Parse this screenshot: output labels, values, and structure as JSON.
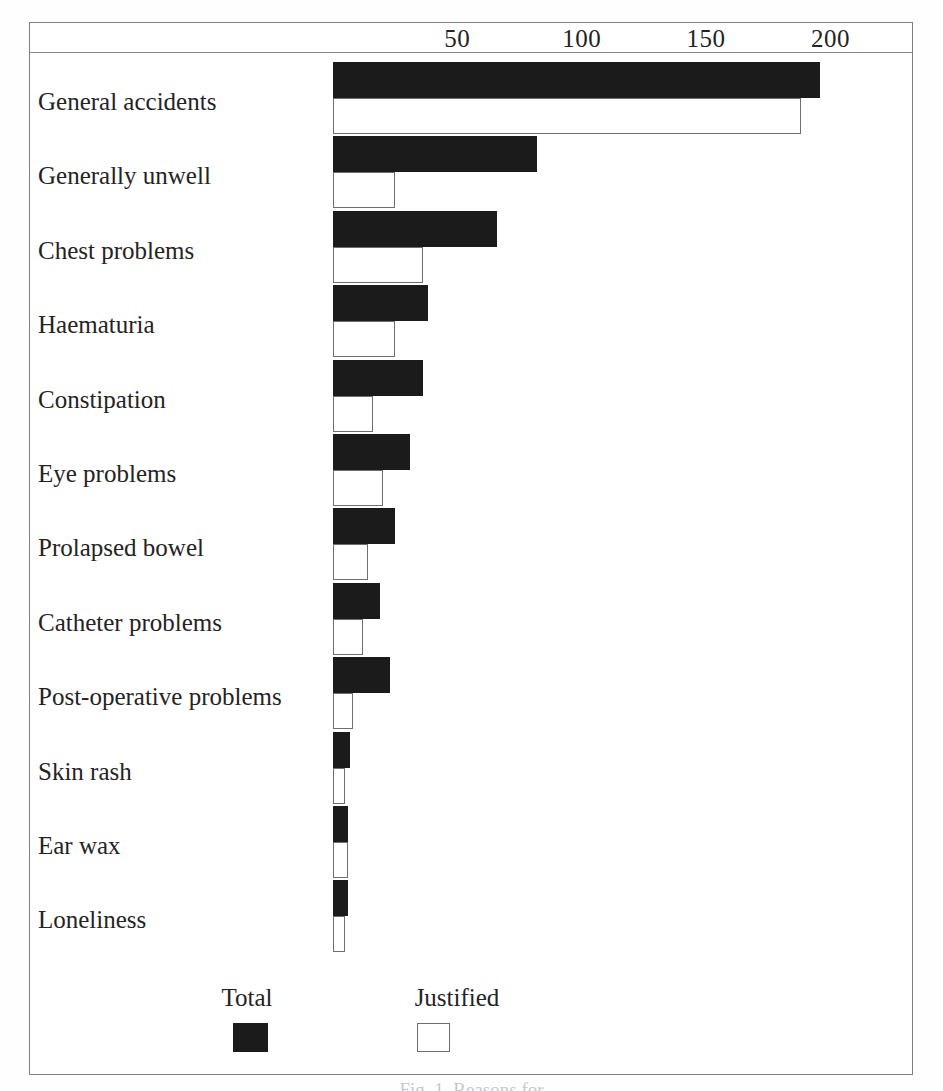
{
  "chart_data": {
    "type": "bar",
    "orientation": "horizontal",
    "title": "",
    "xlabel": "",
    "ylabel": "",
    "xlim": [
      0,
      210
    ],
    "ticks": [
      50,
      100,
      150,
      200
    ],
    "grid": false,
    "legend_position": "bottom",
    "categories": [
      "General accidents",
      "Generally unwell",
      "Chest problems",
      "Haematuria",
      "Constipation",
      "Eye problems",
      "Prolapsed bowel",
      "Catheter problems",
      "Post-operative problems",
      "Skin rash",
      "Ear wax",
      "Loneliness"
    ],
    "series": [
      {
        "name": "Total",
        "swatch": "#1b1b1b",
        "values": [
          196,
          82,
          66,
          38,
          36,
          31,
          25,
          19,
          23,
          7,
          6,
          6
        ]
      },
      {
        "name": "Justified",
        "swatch": "#ffffff",
        "values": [
          188,
          25,
          36,
          25,
          16,
          20,
          14,
          12,
          8,
          5,
          6,
          5
        ]
      }
    ]
  },
  "axis": {
    "tick_labels": [
      "50",
      "100",
      "150",
      "200"
    ]
  },
  "legend": {
    "items": [
      {
        "label": "Total",
        "swatch": "#1b1b1b"
      },
      {
        "label": "Justified",
        "swatch": "#ffffff"
      }
    ]
  },
  "caption": "Fig. 1. Reasons for"
}
